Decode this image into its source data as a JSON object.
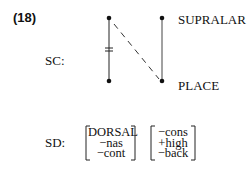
{
  "example_number": "(18)",
  "sc": {
    "label": "SC:",
    "tier_labels": {
      "top": "SUPRALAR",
      "bottom": "PLACE"
    }
  },
  "sd": {
    "label": "SD:",
    "matrix1": [
      "DORSAL",
      "−nas",
      "−cont"
    ],
    "matrix2": [
      "−cons",
      "+high",
      "−back"
    ]
  }
}
